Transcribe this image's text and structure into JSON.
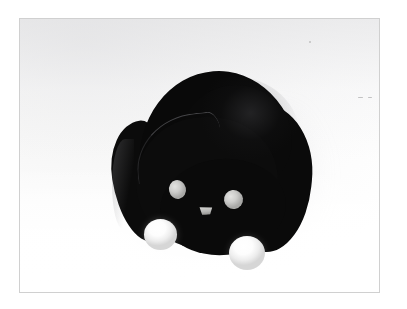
{
  "page": {
    "kind": "photograph",
    "width": 407,
    "height": 309,
    "page_background": "#ffffff"
  },
  "frame": {
    "name": "photo-frame",
    "border_color": "#d0d0d0",
    "border_width_px": 1,
    "x": 19,
    "y": 18,
    "width": 361,
    "height": 275
  },
  "scene": {
    "backdrop_label": "seamless white studio backdrop",
    "backdrop_colors": {
      "highlight": "#ffffff",
      "midtone": "#f4f4f4",
      "corner_shade": "#ececed"
    },
    "shadow_color": "#78787c",
    "lighting": "soft diffuse key light from upper left, shadow falling to the lower right"
  },
  "subject": {
    "label": "black rounded figurine",
    "body_color": "#0a0a0a",
    "highlight_color": "#5a5a5f",
    "seam_color": "#747478",
    "parts": [
      {
        "name": "body-main",
        "label": "main rounded body dome"
      },
      {
        "name": "body-rump",
        "label": "rear body mass"
      },
      {
        "name": "head-front",
        "label": "front head lobe"
      },
      {
        "name": "ear-left",
        "label": "left ear flap"
      }
    ],
    "face": {
      "eyes": [
        {
          "name": "eye-left",
          "label": "left eye",
          "color": "#cdcdcb"
        },
        {
          "name": "eye-right",
          "label": "right eye",
          "color": "#cdcdcb"
        }
      ],
      "nose": {
        "name": "nose",
        "label": "triangular nose",
        "color": "#b6b6b4"
      }
    },
    "feet": [
      {
        "name": "foot-left",
        "label": "left white ball foot",
        "color": "#ffffff"
      },
      {
        "name": "foot-right",
        "label": "right white ball foot",
        "color": "#ffffff"
      }
    ]
  },
  "speckles": [
    {
      "x": 358,
      "y": 97,
      "w": 5,
      "h": 1
    },
    {
      "x": 368,
      "y": 97,
      "w": 4,
      "h": 1
    },
    {
      "x": 309,
      "y": 41,
      "w": 2,
      "h": 2
    }
  ]
}
